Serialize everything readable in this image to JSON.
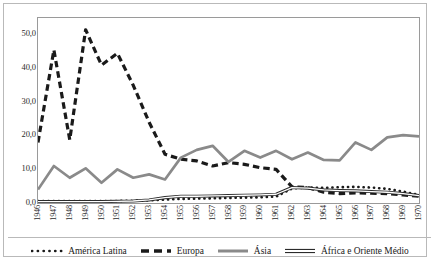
{
  "chart_data": {
    "type": "line",
    "title": "",
    "xlabel": "",
    "ylabel": "",
    "ylim": [
      0,
      55
    ],
    "yticks": [
      "0,0",
      "10,0",
      "20,0",
      "30,0",
      "40,0",
      "50,0"
    ],
    "ytick_values": [
      0,
      10,
      20,
      30,
      40,
      50
    ],
    "grid": false,
    "legend_position": "bottom",
    "categories": [
      "1946",
      "1947",
      "1948",
      "1949",
      "1950",
      "1951",
      "1952",
      "1953",
      "1954",
      "1955",
      "1956",
      "1957",
      "1958",
      "1959",
      "1960",
      "1961",
      "1962",
      "1963",
      "1964",
      "1965",
      "1966",
      "1967",
      "1968",
      "1969",
      "1970"
    ],
    "series": [
      {
        "name": "América Latina",
        "style": "dotted",
        "color": "#1a1a1a",
        "values": [
          0.6,
          0.6,
          0.6,
          0.6,
          0.6,
          0.6,
          0.7,
          0.8,
          1.0,
          1.2,
          1.3,
          1.4,
          1.5,
          1.6,
          1.7,
          1.9,
          4.3,
          4.6,
          4.5,
          4.7,
          4.8,
          4.6,
          4.2,
          3.4,
          2.4
        ]
      },
      {
        "name": "Europa",
        "style": "dashed",
        "color": "#1a1a1a",
        "values": [
          18.0,
          45.5,
          18.8,
          51.5,
          41.0,
          44.5,
          35.0,
          24.0,
          14.5,
          13.0,
          12.5,
          11.0,
          12.0,
          11.5,
          10.5,
          10.0,
          4.8,
          4.6,
          3.2,
          2.8,
          3.0,
          2.9,
          2.8,
          2.4,
          2.0
        ]
      },
      {
        "name": "Ásia",
        "style": "solid-thick",
        "color": "#8a8a8a",
        "values": [
          4.0,
          11.0,
          7.5,
          10.3,
          6.0,
          10.0,
          7.5,
          8.5,
          7.0,
          13.5,
          15.8,
          17.0,
          12.2,
          15.5,
          13.5,
          15.5,
          13.0,
          15.0,
          12.8,
          12.7,
          18.0,
          15.8,
          19.5,
          20.2,
          19.8
        ]
      },
      {
        "name": "África e Oriente Médio",
        "style": "solid-thin",
        "color": "#2b2b2b",
        "values": [
          0.4,
          0.4,
          0.4,
          0.4,
          0.4,
          0.5,
          0.6,
          0.9,
          1.6,
          2.0,
          2.0,
          2.1,
          2.2,
          2.3,
          2.4,
          2.6,
          4.6,
          4.4,
          3.9,
          3.7,
          3.6,
          3.4,
          3.2,
          2.8,
          2.2
        ]
      }
    ]
  },
  "legend": {
    "items": [
      {
        "label": "América Latina",
        "marker": "dotted-line-marker"
      },
      {
        "label": "Europa",
        "marker": "dashed-line-marker"
      },
      {
        "label": "Ásia",
        "marker": "solid-gray-line-marker"
      },
      {
        "label": "África e Oriente Médio",
        "marker": "double-line-marker"
      }
    ]
  }
}
